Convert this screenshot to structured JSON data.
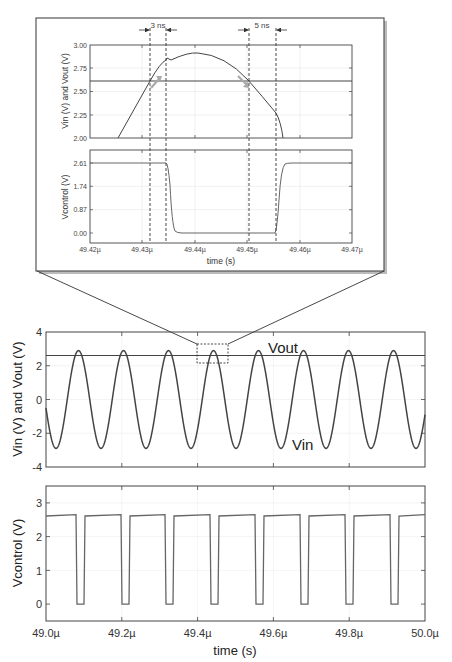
{
  "chart_data": [
    {
      "id": "inset_top",
      "type": "line",
      "xlabel": "",
      "ylabel": "Vin (V) and Vout (V)",
      "xlim": [
        49.42,
        49.47
      ],
      "ylim": [
        2.0,
        3.0
      ],
      "yticks": [
        "2.00",
        "2.25",
        "2.50",
        "2.75",
        "3.00"
      ],
      "annotations": [
        "3 ns",
        "5 ns"
      ],
      "series": [
        {
          "name": "Vout",
          "x": [
            49.42,
            49.47
          ],
          "y": [
            2.61,
            2.61
          ]
        },
        {
          "name": "Vin",
          "x": [
            49.4238,
            49.4313,
            49.4345,
            49.4352,
            49.437,
            49.44,
            49.443,
            49.4465,
            49.45,
            49.4535,
            49.4555,
            49.4562
          ],
          "y": [
            2.0,
            2.61,
            2.83,
            2.81,
            2.86,
            2.9,
            2.88,
            2.8,
            2.62,
            2.4,
            2.25,
            2.0
          ]
        }
      ],
      "grid": true
    },
    {
      "id": "inset_bottom",
      "type": "line",
      "xlabel": "time (s)",
      "ylabel": "Vcontrol (V)",
      "xlim": [
        49.42,
        49.47
      ],
      "ylim": [
        -0.25,
        2.85
      ],
      "xticks": [
        "49.42µ",
        "49.43µ",
        "49.44µ",
        "49.45µ",
        "49.46µ",
        "49.47µ"
      ],
      "yticks": [
        "0.00",
        "0.87",
        "1.74",
        "2.61"
      ],
      "series": [
        {
          "name": "Vcontrol",
          "x": [
            49.42,
            49.4345,
            49.4355,
            49.437,
            49.4555,
            49.4565,
            49.458,
            49.47
          ],
          "y": [
            2.61,
            2.61,
            0.8,
            0.0,
            0.0,
            1.8,
            2.61,
            2.61
          ]
        }
      ],
      "grid": true
    },
    {
      "id": "main_top",
      "type": "line",
      "xlabel": "",
      "ylabel": "Vin (V) and Vout (V)",
      "xlim": [
        49.0,
        50.0
      ],
      "ylim": [
        -4,
        4
      ],
      "yticks": [
        "-4",
        "-2",
        "0",
        "2",
        "4"
      ],
      "legend_labels": [
        "Vout",
        "Vin"
      ],
      "series": [
        {
          "name": "Vout",
          "value": 2.61
        },
        {
          "name": "Vin",
          "amplitude": 2.9,
          "period_us": 0.1185,
          "cycles": 8.5
        }
      ],
      "grid": true
    },
    {
      "id": "main_bottom",
      "type": "line",
      "xlabel": "time (s)",
      "ylabel": "Vcontrol (V)",
      "xlim": [
        49.0,
        50.0
      ],
      "ylim": [
        -0.5,
        3.5
      ],
      "xticks": [
        "49.0µ",
        "49.2µ",
        "49.4µ",
        "49.6µ",
        "49.8µ",
        "50.0µ"
      ],
      "yticks": [
        "0",
        "1",
        "2",
        "3"
      ],
      "series": [
        {
          "name": "Vcontrol",
          "high": 2.61,
          "low": 0.0,
          "pulses_low_start_us": [
            49.08,
            49.2,
            49.32,
            49.44,
            49.56,
            49.67,
            49.79,
            49.91
          ],
          "low_width_us": 0.02
        }
      ],
      "grid": true
    }
  ],
  "labels": {
    "inset_top_ylabel": "Vin (V) and Vout (V)",
    "inset_bottom_ylabel": "Vcontrol (V)",
    "inset_xlabel": "time (s)",
    "ann_3ns": "3 ns",
    "ann_5ns": "5 ns",
    "main_top_ylabel": "Vin (V) and Vout (V)",
    "main_bottom_ylabel": "Vcontrol (V)",
    "main_xlabel": "time (s)",
    "vout_label": "Vout",
    "vin_label": "Vin",
    "inset_top_yticks": [
      "3.00",
      "2.75",
      "2.50",
      "2.25",
      "2.00"
    ],
    "inset_bottom_yticks": [
      "2.61",
      "1.74",
      "0.87",
      "0.00"
    ],
    "inset_xticks": [
      "49.42µ",
      "49.43µ",
      "49.44µ",
      "49.45µ",
      "49.46µ",
      "49.47µ"
    ],
    "main_top_yticks": [
      "4",
      "2",
      "0",
      "-2",
      "-4"
    ],
    "main_bottom_yticks": [
      "3",
      "2",
      "1",
      "0"
    ],
    "main_xticks": [
      "49.0µ",
      "49.2µ",
      "49.4µ",
      "49.6µ",
      "49.8µ",
      "50.0µ"
    ]
  }
}
